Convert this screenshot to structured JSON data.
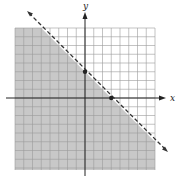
{
  "chart_data": {
    "type": "line",
    "title": "",
    "xlabel": "x",
    "ylabel": "y",
    "xlim": [
      -8,
      8
    ],
    "ylim": [
      -8,
      8
    ],
    "grid": true,
    "grid_step": 1,
    "boundary": {
      "equation": "y = -x + 3",
      "style": "dashed",
      "slope": -1,
      "y_intercept": 3,
      "x_intercept": 3
    },
    "inequality": "y < -x + 3",
    "shaded_region": "below line",
    "points": [
      {
        "x": 0,
        "y": 3,
        "label": "y-intercept"
      },
      {
        "x": 3,
        "y": 0,
        "label": "x-intercept"
      }
    ]
  },
  "colors": {
    "shade": "#c8c8c8",
    "grid": "#9a9a9a",
    "axis": "#222222",
    "line": "#333333"
  },
  "labels": {
    "x_axis": "x",
    "y_axis": "y"
  }
}
